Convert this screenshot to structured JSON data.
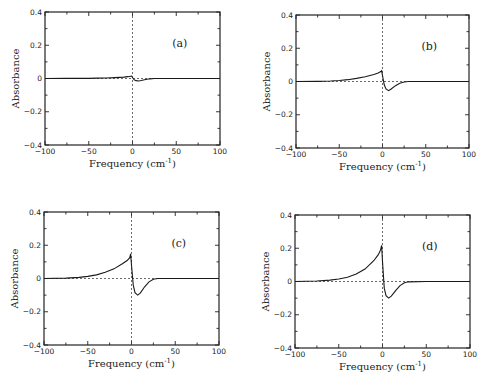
{
  "chart_data": [
    {
      "type": "line",
      "panel_label": "(a)",
      "xlabel": "Frequency (cm",
      "xlabel_sup": "-1",
      "xlabel_close": ")",
      "ylabel": "Absorbance",
      "xlim": [
        -100,
        100
      ],
      "ylim": [
        -0.4,
        0.4
      ],
      "xticks": [
        -100,
        -50,
        0,
        50,
        100
      ],
      "xtick_labels": [
        "−100",
        "−50",
        "0",
        "50",
        "100"
      ],
      "yticks": [
        -0.4,
        -0.2,
        0,
        0.2,
        0.4
      ],
      "ytick_labels": [
        "−0.4",
        "−0.2",
        "0",
        "0.2",
        "0.4"
      ],
      "peak": 0.015,
      "peak_x": -1,
      "trough": -0.015,
      "trough_x": 7,
      "series": [
        {
          "name": "absorbance",
          "x": [
            -100,
            -75,
            -50,
            -40,
            -30,
            -20,
            -10,
            -5,
            -2,
            -1,
            0,
            2,
            4,
            7,
            10,
            15,
            20,
            25,
            50,
            100
          ],
          "y": [
            0,
            0.0005,
            0.001,
            0.002,
            0.003,
            0.005,
            0.008,
            0.011,
            0.014,
            0.015,
            0.006,
            -0.008,
            -0.013,
            -0.015,
            -0.012,
            -0.006,
            -0.002,
            0,
            0,
            0
          ]
        }
      ]
    },
    {
      "type": "line",
      "panel_label": "(b)",
      "xlabel": "Frequency (cm",
      "xlabel_sup": "-1",
      "xlabel_close": ")",
      "ylabel": "Absorbance",
      "xlim": [
        -100,
        100
      ],
      "ylim": [
        -0.4,
        0.4
      ],
      "xticks": [
        -100,
        -50,
        0,
        50,
        100
      ],
      "xtick_labels": [
        "−100",
        "−50",
        "0",
        "50",
        "100"
      ],
      "yticks": [
        -0.4,
        -0.2,
        0,
        0.2,
        0.4
      ],
      "ytick_labels": [
        "−0.4",
        "−0.2",
        "0",
        "0.2",
        "0.4"
      ],
      "peak": 0.065,
      "peak_x": -1,
      "trough": -0.055,
      "trough_x": 7,
      "series": [
        {
          "name": "absorbance",
          "x": [
            -100,
            -75,
            -60,
            -50,
            -40,
            -30,
            -20,
            -10,
            -5,
            -2,
            -1,
            0,
            2,
            4,
            7,
            10,
            15,
            20,
            25,
            30,
            50,
            100
          ],
          "y": [
            0,
            0.001,
            0.003,
            0.006,
            0.011,
            0.019,
            0.029,
            0.042,
            0.051,
            0.06,
            0.065,
            0.035,
            -0.02,
            -0.045,
            -0.055,
            -0.045,
            -0.025,
            -0.01,
            -0.003,
            0,
            0,
            0
          ]
        }
      ]
    },
    {
      "type": "line",
      "panel_label": "(c)",
      "xlabel": "Frequency (cm",
      "xlabel_sup": "-1",
      "xlabel_close": ")",
      "ylabel": "Absorbance",
      "xlim": [
        -100,
        100
      ],
      "ylim": [
        -0.4,
        0.4
      ],
      "xticks": [
        -100,
        -50,
        0,
        50,
        100
      ],
      "xtick_labels": [
        "−100",
        "−50",
        "0",
        "50",
        "100"
      ],
      "yticks": [
        -0.4,
        -0.2,
        0,
        0.2,
        0.4
      ],
      "ytick_labels": [
        "−0.4",
        "−0.2",
        "0",
        "0.2",
        "0.4"
      ],
      "peak": 0.15,
      "peak_x": -1,
      "trough": -0.1,
      "trough_x": 7,
      "series": [
        {
          "name": "absorbance",
          "x": [
            -100,
            -75,
            -60,
            -50,
            -40,
            -30,
            -20,
            -10,
            -5,
            -2,
            -1,
            0,
            2,
            4,
            7,
            10,
            15,
            20,
            25,
            30,
            50,
            100
          ],
          "y": [
            0,
            0.002,
            0.007,
            0.013,
            0.022,
            0.037,
            0.058,
            0.09,
            0.108,
            0.125,
            0.148,
            0.08,
            -0.04,
            -0.085,
            -0.1,
            -0.088,
            -0.05,
            -0.02,
            -0.005,
            0,
            0,
            0
          ]
        }
      ]
    },
    {
      "type": "line",
      "panel_label": "(d)",
      "xlabel": "Frequency (cm",
      "xlabel_sup": "-1",
      "xlabel_close": ")",
      "ylabel": "Absorbance",
      "xlim": [
        -100,
        100
      ],
      "ylim": [
        -0.4,
        0.4
      ],
      "xticks": [
        -100,
        -50,
        0,
        50,
        100
      ],
      "xtick_labels": [
        "−100",
        "−50",
        "0",
        "50",
        "100"
      ],
      "yticks": [
        -0.4,
        -0.2,
        0,
        0.2,
        0.4
      ],
      "ytick_labels": [
        "−0.4",
        "−0.2",
        "0",
        "0.2",
        "0.4"
      ],
      "peak": 0.22,
      "peak_x": -1,
      "trough": -0.1,
      "trough_x": 7,
      "series": [
        {
          "name": "absorbance",
          "x": [
            -100,
            -75,
            -60,
            -50,
            -40,
            -30,
            -20,
            -10,
            -5,
            -3,
            -2,
            -1,
            0,
            2,
            4,
            7,
            10,
            15,
            20,
            25,
            30,
            50,
            100
          ],
          "y": [
            0,
            0.003,
            0.008,
            0.015,
            0.026,
            0.045,
            0.075,
            0.125,
            0.16,
            0.18,
            0.195,
            0.218,
            0.12,
            -0.04,
            -0.085,
            -0.1,
            -0.088,
            -0.055,
            -0.025,
            -0.008,
            -0.002,
            0,
            0
          ]
        }
      ]
    }
  ],
  "panels": [
    {
      "label": "(a)",
      "frame": {
        "x0": 45,
        "y0": 12,
        "x1": 220,
        "y1": 145
      }
    },
    {
      "label": "(b)",
      "frame": {
        "x0": 296,
        "y0": 15,
        "x1": 469,
        "y1": 148
      }
    },
    {
      "label": "(c)",
      "frame": {
        "x0": 44,
        "y0": 212,
        "x1": 219,
        "y1": 345
      }
    },
    {
      "label": "(d)",
      "frame": {
        "x0": 295,
        "y0": 215,
        "x1": 470,
        "y1": 348
      }
    }
  ]
}
